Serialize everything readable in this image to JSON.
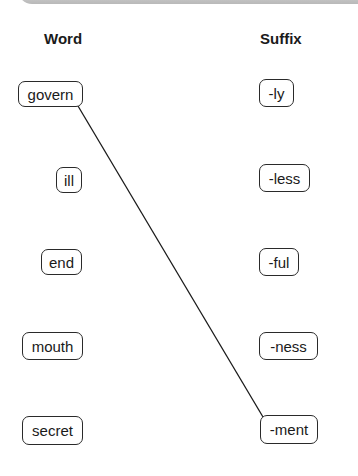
{
  "headers": {
    "word": "Word",
    "suffix": "Suffix"
  },
  "words": [
    "govern",
    "ill",
    "end",
    "mouth",
    "secret"
  ],
  "suffixes": [
    "-ly",
    "-less",
    "-ful",
    "-ness",
    "-ment"
  ],
  "connections": [
    {
      "word": "govern",
      "suffix": "-ment"
    }
  ]
}
